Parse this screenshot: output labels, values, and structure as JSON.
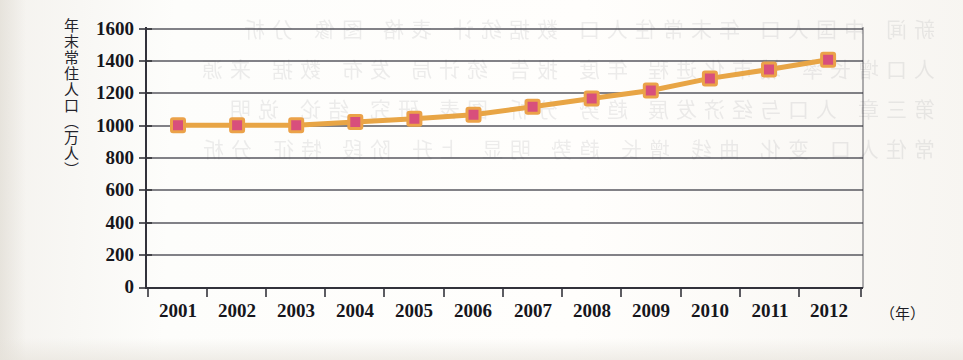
{
  "figure": {
    "y_axis_title": "年末常住人口（万人）",
    "x_axis_unit": "（年）"
  },
  "chart_data": {
    "type": "line",
    "title": "",
    "subtitle": "",
    "xlabel": "（年）",
    "ylabel": "年末常住人口（万人）",
    "categories": [
      "2001",
      "2002",
      "2003",
      "2004",
      "2005",
      "2006",
      "2007",
      "2008",
      "2009",
      "2010",
      "2011",
      "2012"
    ],
    "values": [
      1005,
      1005,
      1005,
      1025,
      1045,
      1070,
      1120,
      1170,
      1220,
      1295,
      1350,
      1410
    ],
    "series": [
      {
        "name": "年末常住人口",
        "values": [
          1005,
          1005,
          1005,
          1025,
          1045,
          1070,
          1120,
          1170,
          1220,
          1295,
          1350,
          1410
        ]
      }
    ],
    "ylim": [
      0,
      1600
    ],
    "yticks": [
      0,
      200,
      400,
      600,
      800,
      1000,
      1200,
      1400,
      1600
    ],
    "ytick_labels": [
      "0",
      "200",
      "400",
      "600",
      "800",
      "1000",
      "1200",
      "1400",
      "1600"
    ],
    "xtick_labels": [
      "2001",
      "2002",
      "2003",
      "2004",
      "2005",
      "2006",
      "2007",
      "2008",
      "2009",
      "2010",
      "2011",
      "2012"
    ],
    "grid": true,
    "grid_axis": "y",
    "legend": false,
    "legend_position": "none",
    "line_color": "#e8a545",
    "marker_color": "#d8507c",
    "marker_edge_color": "#eba24a",
    "marker_shape": "square",
    "axis_color": "#3a3a42",
    "grid_color": "#4a4a52"
  },
  "colors": {
    "line": "#e8a545",
    "marker_fill": "#d8507c",
    "marker_edge": "#eba24a",
    "axis": "#3a3a42",
    "grid": "#4a4a52",
    "text": "#16161c",
    "paper": "#fdfcfa"
  },
  "ghost_text": "新闻 中国人口 年末常住人口 数据统计 表格 图像 分析\n人口增长率 城市化进程 年度 报告 统计局 发布 数据 来源\n第三章 人口与经济发展 趋势 分析 图表 研究 结论 说明\n常住人口 变化 曲线 增长 趋势 明显 上升 阶段 特征 分析"
}
